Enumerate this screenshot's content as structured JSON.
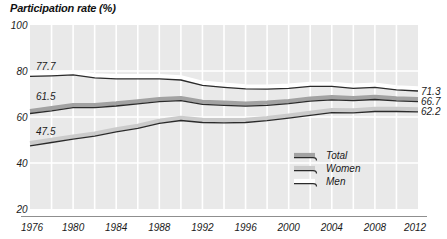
{
  "title": "Participation rate (%)",
  "chart_data": {
    "type": "line",
    "title": "Participation rate (%)",
    "xlim": [
      1976,
      2012
    ],
    "ylim": [
      20,
      100
    ],
    "x_ticks": [
      1976,
      1980,
      1984,
      1988,
      1992,
      1996,
      2000,
      2004,
      2008,
      2012
    ],
    "y_ticks": [
      100,
      80,
      60,
      40,
      20
    ],
    "grid": true,
    "gridline_interval_years": 2,
    "x": [
      1976,
      1978,
      1980,
      1982,
      1984,
      1986,
      1988,
      1990,
      1992,
      1994,
      1996,
      1998,
      2000,
      2002,
      2004,
      2006,
      2008,
      2010,
      2012
    ],
    "series": [
      {
        "name": "Total",
        "start_label": "61.5",
        "end_label": "66.7",
        "band_color": "#a2a2a2",
        "values": [
          61.5,
          62.7,
          64.1,
          64.1,
          64.8,
          65.7,
          66.7,
          67.1,
          65.5,
          65.1,
          64.7,
          65.1,
          65.8,
          66.9,
          67.5,
          67.1,
          67.6,
          67.0,
          66.7
        ]
      },
      {
        "name": "Women",
        "start_label": "47.5",
        "end_label": "62.2",
        "band_color": "#cbcbcb",
        "values": [
          47.5,
          48.9,
          50.4,
          51.7,
          53.5,
          55.1,
          57.2,
          58.5,
          57.6,
          57.5,
          57.6,
          58.4,
          59.5,
          60.7,
          61.9,
          61.8,
          62.4,
          62.4,
          62.2
        ]
      },
      {
        "name": "Men",
        "start_label": "77.7",
        "end_label": "71.3",
        "band_color": "#ffffff",
        "values": [
          77.7,
          77.9,
          78.3,
          77.0,
          76.6,
          76.6,
          76.6,
          76.1,
          73.8,
          72.9,
          72.2,
          72.1,
          72.5,
          73.3,
          73.3,
          72.5,
          72.9,
          71.8,
          71.3
        ]
      }
    ],
    "legend_position": "inside-bottom-right",
    "legend": [
      "Total",
      "Women",
      "Men"
    ]
  },
  "colors": {
    "page_bg": "#ffffff",
    "plot_bg": "#e9e9e9",
    "gridline": "#ffffff",
    "data_line": "#2b2b2b",
    "axis_line": "#8f8f8f",
    "text": "#1a1a1a"
  }
}
